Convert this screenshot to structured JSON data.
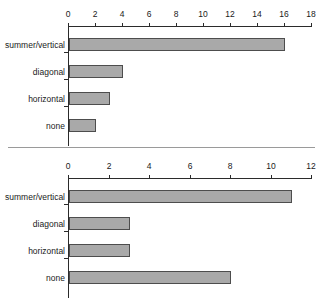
{
  "figure": {
    "background_color": "#ffffff",
    "bar_fill_color": "#a9a9a9",
    "bar_border_color": "#4d4d4d",
    "axis_color": "#2b2b2b",
    "divider_color": "#9a9a9a"
  },
  "chart_data": [
    {
      "type": "bar",
      "orientation": "horizontal",
      "title": "",
      "subtitle": "",
      "xlabel": "",
      "ylabel": "",
      "categories": [
        "summer/vertical",
        "diagonal",
        "horizontal",
        "none"
      ],
      "values": [
        16,
        4,
        3,
        2
      ],
      "xlim": [
        0,
        18
      ],
      "xticks": [
        0,
        2,
        4,
        6,
        8,
        10,
        12,
        14,
        16,
        18
      ],
      "xticklabels": [
        "0",
        "2",
        "4",
        "6",
        "8",
        "10",
        "12",
        "14",
        "16",
        "18"
      ],
      "xaxis_position": "top",
      "grid": false,
      "legend": null
    },
    {
      "type": "bar",
      "orientation": "horizontal",
      "title": "",
      "subtitle": "",
      "xlabel": "",
      "ylabel": "",
      "categories": [
        "summer/vertical",
        "diagonal",
        "horizontal",
        "none"
      ],
      "values": [
        11,
        3,
        3,
        8
      ],
      "xlim": [
        0,
        12
      ],
      "xticks": [
        0,
        2,
        4,
        6,
        8,
        10,
        12
      ],
      "xticklabels": [
        "0",
        "2",
        "4",
        "6",
        "8",
        "10",
        "12"
      ],
      "xaxis_position": "top",
      "grid": false,
      "legend": null
    }
  ]
}
